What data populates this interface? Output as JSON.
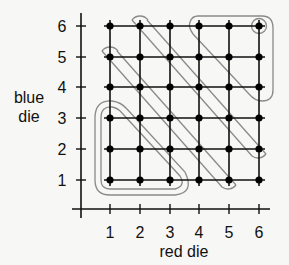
{
  "diagram": {
    "type": "dice-sample-space-grid",
    "colors": {
      "background": "#f7f7f5",
      "grid": "#111111",
      "point": "#000000",
      "loop": "#8a8a8a"
    },
    "x_axis": {
      "title": "red die",
      "ticks": [
        "1",
        "2",
        "3",
        "4",
        "5",
        "6"
      ]
    },
    "y_axis": {
      "title_line1": "blue",
      "title_line2": "die",
      "ticks": [
        "1",
        "2",
        "3",
        "4",
        "5",
        "6"
      ]
    },
    "points": "all 36 outcomes (red, blue) with red 1-6 and blue 1-6",
    "events": [
      {
        "name": "sum-at-most-4",
        "shape": "double rounded triangle",
        "outcomes": [
          [
            1,
            1
          ],
          [
            2,
            1
          ],
          [
            3,
            1
          ],
          [
            1,
            2
          ],
          [
            2,
            2
          ],
          [
            1,
            3
          ]
        ]
      },
      {
        "name": "sum-equals-6",
        "shape": "diagonal stadium",
        "outcomes": [
          [
            1,
            5
          ],
          [
            2,
            4
          ],
          [
            3,
            3
          ],
          [
            4,
            2
          ],
          [
            5,
            1
          ]
        ]
      },
      {
        "name": "sum-equals-8",
        "shape": "diagonal stadium",
        "outcomes": [
          [
            2,
            6
          ],
          [
            3,
            5
          ],
          [
            4,
            4
          ],
          [
            5,
            3
          ],
          [
            6,
            2
          ]
        ]
      },
      {
        "name": "sum-at-least-10",
        "shape": "rounded triangle",
        "outcomes": [
          [
            4,
            6
          ],
          [
            5,
            6
          ],
          [
            6,
            6
          ],
          [
            5,
            5
          ],
          [
            6,
            5
          ],
          [
            6,
            4
          ]
        ]
      },
      {
        "name": "double-six",
        "shape": "circle",
        "outcomes": [
          [
            6,
            6
          ]
        ]
      }
    ]
  }
}
